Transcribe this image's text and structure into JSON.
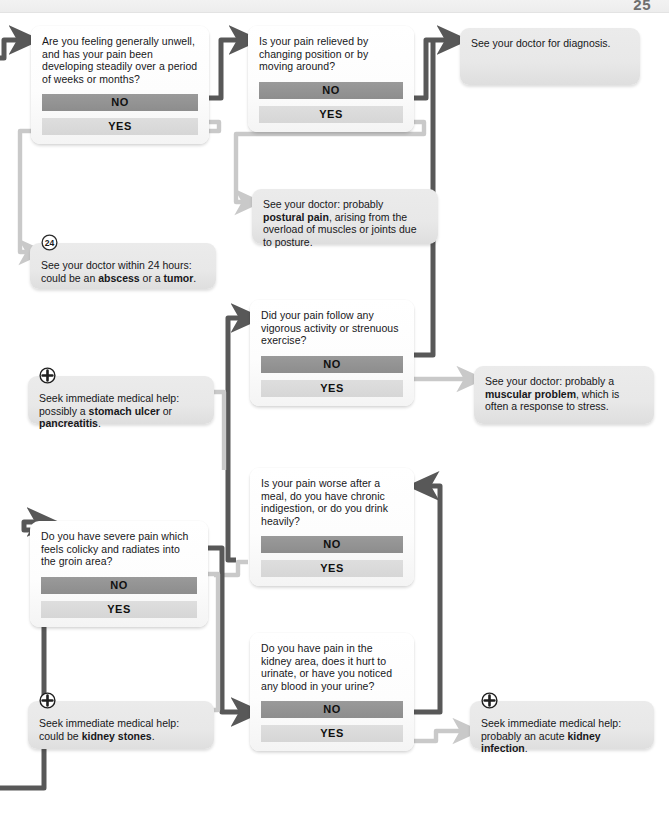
{
  "page": {
    "number": "25"
  },
  "colors": {
    "no_bar": "#919191",
    "yes_bar": "#dcdcdc",
    "wire_active": "#585858",
    "wire_inactive": "#c9c9c9",
    "box_fill": "#fdfdfd",
    "outcome_fill": "#e8e8e8",
    "text": "#17171a"
  },
  "labels": {
    "no": "NO",
    "yes": "YES"
  },
  "icons": {
    "medical_cross": "circled-plus-icon",
    "hours24": "circled-24-icon",
    "arrow": "arrow-head-icon"
  },
  "nodes": {
    "q_unwell": {
      "kind": "question",
      "text": "Are you feeling generally unwell, and has your pain been developing steadily over a period of weeks or months?"
    },
    "q_relieved": {
      "kind": "question",
      "text": "Is your pain relieved by changing position or by moving around?"
    },
    "out_diagnosis": {
      "kind": "outcome",
      "text": "See your doctor for diagnosis."
    },
    "out_postural": {
      "kind": "outcome",
      "text_parts": [
        {
          "t": "See your doctor: probably ",
          "b": false
        },
        {
          "t": "postural pain",
          "b": true
        },
        {
          "t": ", arising from the overload of muscles or joints due to posture.",
          "b": false
        }
      ],
      "text": "See your doctor: probably postural pain, arising from the overload of muscles or joints due to posture."
    },
    "out_abscess": {
      "kind": "outcome",
      "icon": "circled-24-icon",
      "text_parts": [
        {
          "t": "See your doctor within 24 hours: could be an ",
          "b": false
        },
        {
          "t": "abscess",
          "b": true
        },
        {
          "t": " or a ",
          "b": false
        },
        {
          "t": "tumor",
          "b": true
        },
        {
          "t": ".",
          "b": false
        }
      ],
      "text": "See your doctor within 24 hours: could be an abscess or a tumor."
    },
    "q_vigorous": {
      "kind": "question",
      "text": "Did your pain follow any vigorous activity or strenuous exercise?"
    },
    "out_muscular": {
      "kind": "outcome",
      "text_parts": [
        {
          "t": "See your doctor: probably a ",
          "b": false
        },
        {
          "t": "muscular problem",
          "b": true
        },
        {
          "t": ", which is often a response to stress.",
          "b": false
        }
      ],
      "text": "See your doctor: probably a muscular problem, which is often a response to stress."
    },
    "out_ulcer": {
      "kind": "outcome",
      "icon": "circled-plus-icon",
      "text_parts": [
        {
          "t": "Seek immediate medical help: possibly a ",
          "b": false
        },
        {
          "t": "stomach ulcer",
          "b": true
        },
        {
          "t": " or ",
          "b": false
        },
        {
          "t": "pancreatitis",
          "b": true
        },
        {
          "t": ".",
          "b": false
        }
      ],
      "text": "Seek immediate medical help: possibly a stomach ulcer or pancreatitis."
    },
    "q_meal": {
      "kind": "question",
      "text": "Is your pain worse after a meal, do you have chronic indigestion, or do you drink heavily?"
    },
    "q_colicky": {
      "kind": "question",
      "text": "Do you have severe pain which feels colicky and radiates into the groin area?"
    },
    "q_kidney": {
      "kind": "question",
      "text": "Do you have pain in the kidney area, does it hurt to urinate, or have you noticed any blood in your urine?"
    },
    "out_stones": {
      "kind": "outcome",
      "icon": "circled-plus-icon",
      "text_parts": [
        {
          "t": "Seek immediate medical help: could be ",
          "b": false
        },
        {
          "t": "kidney stones",
          "b": true
        },
        {
          "t": ".",
          "b": false
        }
      ],
      "text": "Seek immediate medical help: could be kidney stones."
    },
    "out_infection": {
      "kind": "outcome",
      "icon": "circled-plus-icon",
      "text_parts": [
        {
          "t": "Seek immediate medical help: probably an acute ",
          "b": false
        },
        {
          "t": "kidney infection",
          "b": true
        },
        {
          "t": ".",
          "b": false
        }
      ],
      "text": "Seek immediate medical help: probably an acute kidney infection."
    }
  }
}
